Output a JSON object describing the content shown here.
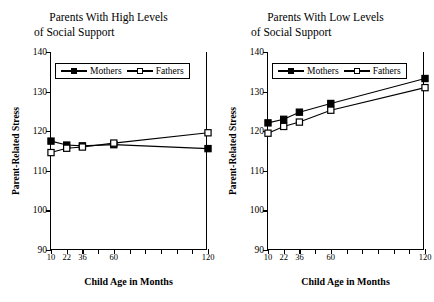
{
  "figure": {
    "width": 434,
    "height": 302,
    "background": "#ffffff",
    "ink": "#000000"
  },
  "axis": {
    "ylabel": "Parent-Related Stress",
    "xlabel": "Child Age in Months",
    "yticks": [
      90,
      100,
      110,
      120,
      130,
      140
    ],
    "ylim": [
      90,
      140
    ],
    "xtick_count": 11,
    "xtick_labels": [
      "10",
      "22",
      "36",
      "60",
      "120"
    ],
    "xtick_label_slots": [
      0,
      1,
      2,
      4,
      10
    ]
  },
  "legend": {
    "mothers_label": "Mothers",
    "fathers_label": "Fathers",
    "mothers_marker": "filled-square",
    "fathers_marker": "open-square"
  },
  "panels": [
    {
      "id": "high-support",
      "title_line1": "Parents With High Levels",
      "title_line2": "of Social Support"
    },
    {
      "id": "low-support",
      "title_line1": "Parents With Low Levels",
      "title_line2": "of Social Support"
    }
  ],
  "chart_data": [
    {
      "type": "line",
      "title": "Parents With High Levels of Social Support",
      "xlabel": "Child Age in Months",
      "ylabel": "Parent-Related Stress",
      "categories": [
        "10",
        "22",
        "36",
        "60",
        "120"
      ],
      "category_slots": [
        0,
        1,
        2,
        4,
        10
      ],
      "ylim": [
        90,
        140
      ],
      "yticks": [
        90,
        100,
        110,
        120,
        130,
        140
      ],
      "grid": false,
      "legend_position": "upper-left-inside",
      "series": [
        {
          "name": "Mothers",
          "marker": "filled-square",
          "values": [
            117.5,
            116.5,
            116.3,
            116.6,
            115.6
          ]
        },
        {
          "name": "Fathers",
          "marker": "open-square",
          "values": [
            114.6,
            115.7,
            116.0,
            117.0,
            119.6
          ]
        }
      ]
    },
    {
      "type": "line",
      "title": "Parents With Low Levels of Social Support",
      "xlabel": "Child Age in Months",
      "ylabel": "Parent-Related Stress",
      "categories": [
        "10",
        "22",
        "36",
        "60",
        "120"
      ],
      "category_slots": [
        0,
        1,
        2,
        4,
        10
      ],
      "ylim": [
        90,
        140
      ],
      "yticks": [
        90,
        100,
        110,
        120,
        130,
        140
      ],
      "grid": false,
      "legend_position": "upper-left-inside",
      "series": [
        {
          "name": "Mothers",
          "marker": "filled-square",
          "values": [
            122.1,
            123.0,
            124.8,
            127.0,
            133.3
          ]
        },
        {
          "name": "Fathers",
          "marker": "open-square",
          "values": [
            119.5,
            121.2,
            122.3,
            125.3,
            131.0
          ]
        }
      ]
    }
  ]
}
